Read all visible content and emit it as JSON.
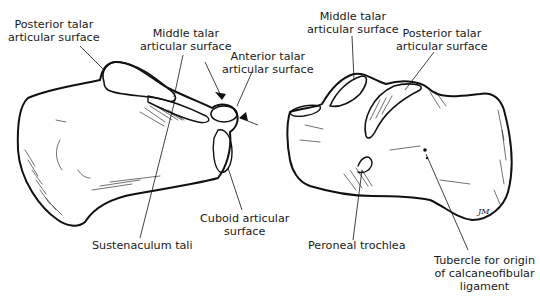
{
  "figure": {
    "left_view": {
      "labels": [
        {
          "id": "posterior",
          "lines": [
            "Posterior talar",
            "articular surface"
          ]
        },
        {
          "id": "middle",
          "lines": [
            "Middle talar",
            "articular surface"
          ]
        },
        {
          "id": "anterior",
          "lines": [
            "Anterior talar",
            "articular surface"
          ]
        },
        {
          "id": "cuboid",
          "lines": [
            "Cuboid articular",
            "surface"
          ]
        },
        {
          "id": "sustentaculum",
          "lines": [
            "Sustenaculum tali"
          ]
        }
      ]
    },
    "right_view": {
      "labels": [
        {
          "id": "middle",
          "lines": [
            "Middle talar",
            "articular surface"
          ]
        },
        {
          "id": "posterior",
          "lines": [
            "Posterior talar",
            "articular surface"
          ]
        },
        {
          "id": "peroneal",
          "lines": [
            "Peroneal trochlea"
          ]
        },
        {
          "id": "tubercle",
          "lines": [
            "Tubercle for origin",
            "of calcaneofibular",
            "ligament"
          ]
        }
      ]
    },
    "signature": "JM",
    "colors": {
      "ink": "#111111",
      "background": "#ffffff"
    }
  }
}
